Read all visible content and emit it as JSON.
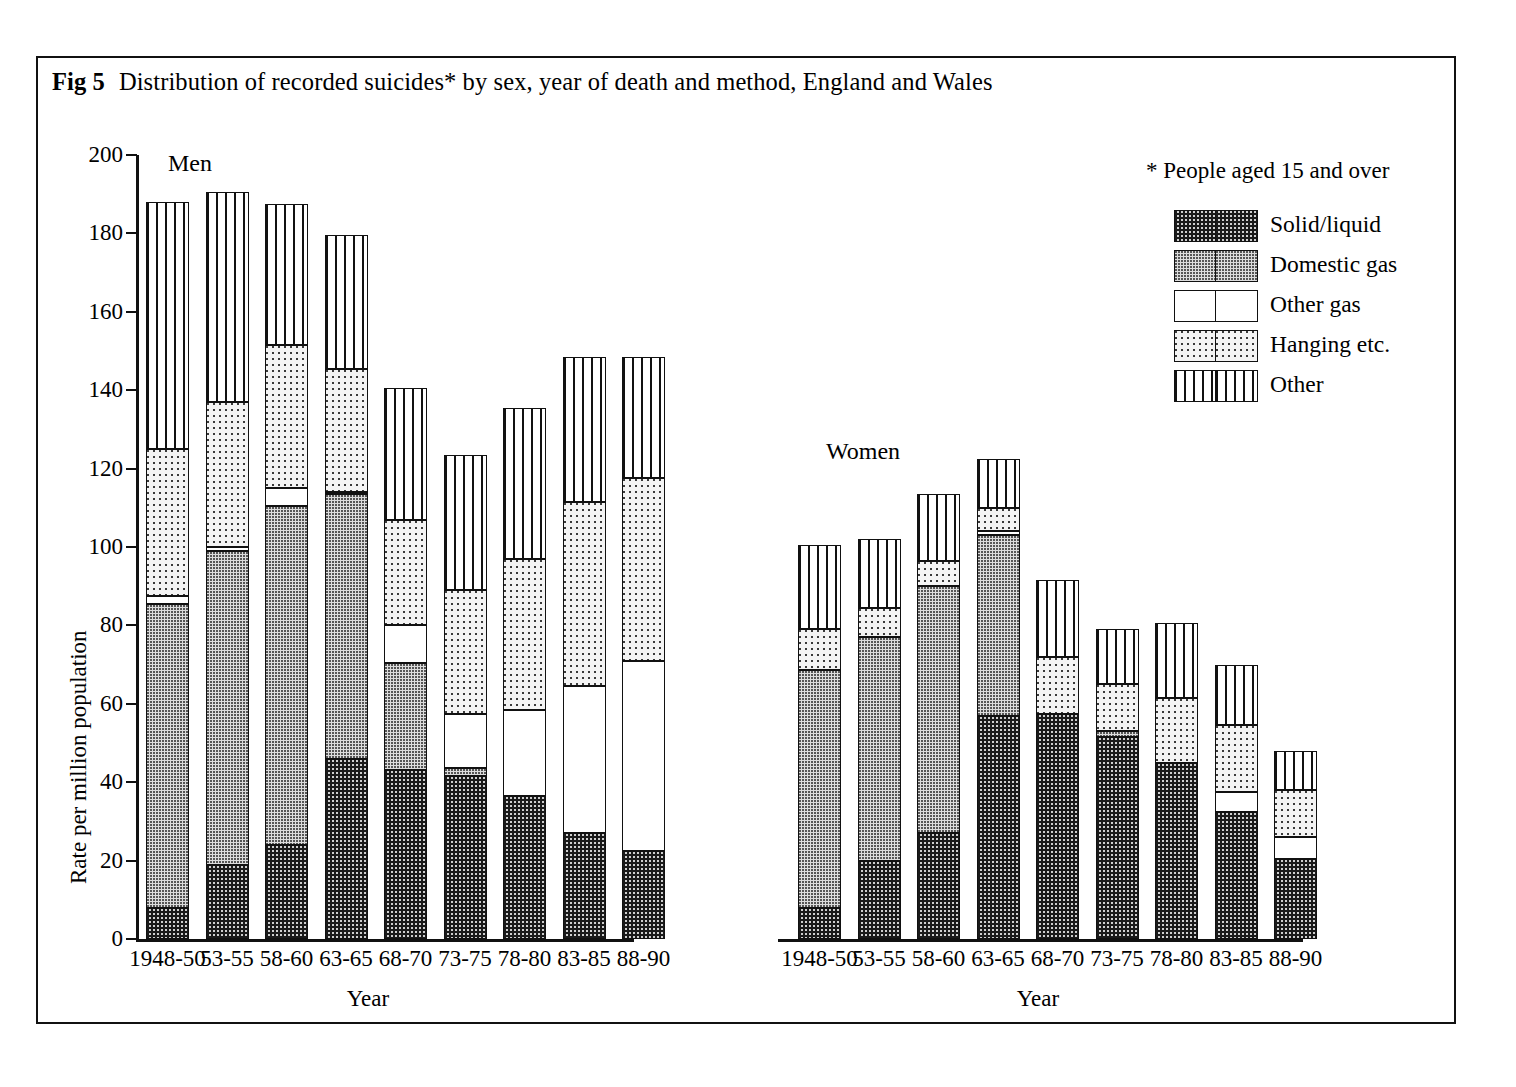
{
  "figure": {
    "number": "Fig 5",
    "title": "Distribution of recorded suicides* by sex, year of death and method, England and Wales"
  },
  "legend": {
    "note": "* People aged 15 and over",
    "items": [
      {
        "key": "solidliquid",
        "label": "Solid/liquid"
      },
      {
        "key": "domesticgas",
        "label": "Domestic gas"
      },
      {
        "key": "othergas",
        "label": "Other gas"
      },
      {
        "key": "hanging",
        "label": "Hanging etc."
      },
      {
        "key": "other",
        "label": "Other"
      }
    ]
  },
  "axes": {
    "ylabel": "Rate per million population",
    "yticks": [
      "0",
      "20",
      "40",
      "60",
      "80",
      "100",
      "120",
      "140",
      "160",
      "180",
      "200"
    ],
    "xlabel_men": "Year",
    "xlabel_women": "Year",
    "panel_men": "Men",
    "panel_women": "Women"
  },
  "chart_data": {
    "type": "bar",
    "subtype": "stacked",
    "title": "Distribution of recorded suicides* by sex, year of death and method, England and Wales",
    "xlabel": "Year",
    "ylabel": "Rate per million population",
    "ylim": [
      0,
      200
    ],
    "ytick_step": 20,
    "grid": false,
    "legend_position": "top-right",
    "annotations": [
      "* People aged 15 and over"
    ],
    "categories": [
      "1948-50",
      "53-55",
      "58-60",
      "63-65",
      "68-70",
      "73-75",
      "78-80",
      "83-85",
      "88-90"
    ],
    "panels": [
      {
        "name": "Men",
        "series": [
          {
            "name": "Solid/liquid",
            "values": [
              8.0,
              19.0,
              24.0,
              46.0,
              43.0,
              41.5,
              36.5,
              27.0,
              22.5
            ]
          },
          {
            "name": "Domestic gas",
            "values": [
              77.5,
              80.0,
              86.5,
              67.5,
              27.5,
              2.0,
              0.0,
              0.0,
              0.0
            ]
          },
          {
            "name": "Other gas",
            "values": [
              2.0,
              1.0,
              4.5,
              0.5,
              9.5,
              14.0,
              22.0,
              37.5,
              48.5
            ]
          },
          {
            "name": "Hanging etc.",
            "values": [
              37.5,
              37.0,
              36.5,
              31.5,
              27.0,
              31.5,
              38.5,
              47.0,
              46.5
            ]
          },
          {
            "name": "Other",
            "values": [
              63.0,
              53.5,
              36.0,
              34.0,
              33.5,
              34.5,
              38.5,
              37.0,
              31.0
            ]
          }
        ],
        "totals": [
          188.0,
          190.5,
          187.5,
          179.5,
          140.5,
          123.5,
          135.5,
          148.5,
          148.5
        ]
      },
      {
        "name": "Women",
        "series": [
          {
            "name": "Solid/liquid",
            "values": [
              8.0,
              20.0,
              27.0,
              57.0,
              57.5,
              51.5,
              45.0,
              32.5,
              20.5
            ]
          },
          {
            "name": "Domestic gas",
            "values": [
              60.5,
              57.0,
              63.0,
              46.0,
              0.0,
              1.5,
              0.0,
              0.0,
              0.0
            ]
          },
          {
            "name": "Other gas",
            "values": [
              0.0,
              0.0,
              0.0,
              1.0,
              0.0,
              0.0,
              0.0,
              5.0,
              5.5
            ]
          },
          {
            "name": "Hanging etc.",
            "values": [
              10.5,
              7.5,
              6.5,
              6.0,
              14.5,
              12.0,
              16.5,
              17.0,
              12.0
            ]
          },
          {
            "name": "Other",
            "values": [
              21.5,
              17.5,
              17.0,
              12.5,
              19.5,
              14.0,
              19.0,
              15.5,
              10.0
            ]
          }
        ],
        "totals": [
          100.5,
          102.0,
          113.5,
          122.5,
          91.5,
          79.0,
          80.5,
          70.0,
          48.0
        ]
      }
    ]
  }
}
